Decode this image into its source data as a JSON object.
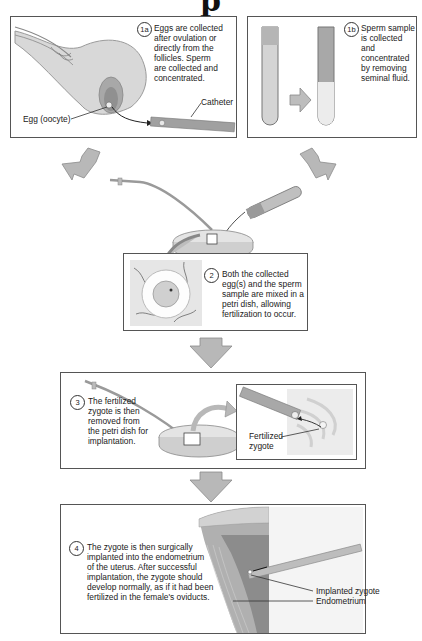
{
  "title_fragment": "p",
  "steps": {
    "s1a": {
      "number": "1a",
      "caption_lines": [
        "Eggs are collected",
        "after ovulation or",
        "directly from the",
        "follicles. Sperm",
        "are collected and",
        "concentrated."
      ],
      "labels": {
        "egg": "Egg (oocyte)",
        "catheter": "Catheter"
      }
    },
    "s1b": {
      "number": "1b",
      "caption_lines": [
        "Sperm sample",
        "is collected and",
        "concentrated",
        "by removing",
        "seminal fluid."
      ]
    },
    "s2": {
      "number": "2",
      "caption_lines": [
        "Both the collected",
        "egg(s) and the sperm",
        "sample are mixed in a",
        "petri dish, allowing",
        "fertilization to occur."
      ]
    },
    "s3": {
      "number": "3",
      "caption_lines": [
        "The fertilized",
        "zygote is then",
        "removed from",
        "the petri dish for",
        "implantation."
      ],
      "labels": {
        "zygote_line1": "Fertilized",
        "zygote_line2": "zygote"
      }
    },
    "s4": {
      "number": "4",
      "caption_lines": [
        "The zygote is then surgically",
        "implanted into the endometrium",
        "of the uterus. After successful",
        "implantation, the zygote should",
        "develop normally, as if it had been",
        "fertilized in the female's oviducts."
      ],
      "labels": {
        "implanted": "Implanted zygote",
        "endometrium": "Endometrium"
      }
    }
  },
  "colors": {
    "border": "#555555",
    "arrow_fill": "#b8b8b8",
    "arrow_stroke": "#8a8a8a",
    "tissue_dark": "#8c8c8c",
    "tissue_mid": "#b5b5b5",
    "tissue_light": "#d6d6d6"
  }
}
